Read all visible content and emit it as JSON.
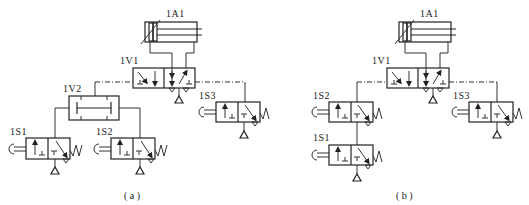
{
  "diagram_a": {
    "caption": "( a )",
    "cylinder": "1A1",
    "main_valve": "1V1",
    "shuttle_valve": "1V2",
    "sensor_valves": [
      "1S1",
      "1S2",
      "1S3"
    ]
  },
  "diagram_b": {
    "caption": "( b )",
    "cylinder": "1A1",
    "main_valve": "1V1",
    "sensor_valves": [
      "1S2",
      "1S1",
      "1S3"
    ]
  }
}
